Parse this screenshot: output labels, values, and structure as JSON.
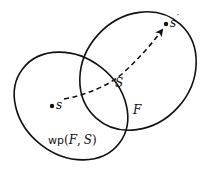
{
  "diagram": {
    "regions": [
      {
        "id": "wp-region",
        "label": "wp(F, S)"
      },
      {
        "id": "f-region",
        "label": "F"
      }
    ],
    "points": [
      {
        "id": "start-state",
        "label": "s"
      },
      {
        "id": "end-state",
        "label": "s'"
      }
    ],
    "path": {
      "label": "S",
      "style": "dashed-arrow"
    },
    "labels": {
      "s": "s",
      "s_prime": "s",
      "prime": "′",
      "S": "S",
      "F": "F",
      "wp_prefix": "wp",
      "wp_open": "(",
      "wp_F": "F",
      "wp_comma": ",",
      "wp_S": "S",
      "wp_close": ")"
    },
    "colors": {
      "stroke": "#111111",
      "background": "#ffffff"
    }
  }
}
